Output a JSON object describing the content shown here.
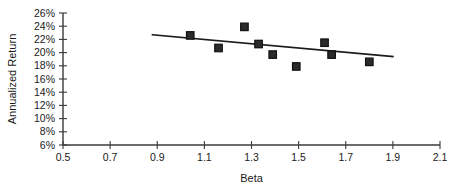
{
  "chart_data": {
    "type": "scatter",
    "title": "",
    "xlabel": "Beta",
    "ylabel": "Annualized Return",
    "xlim": [
      0.5,
      2.1
    ],
    "ylim": [
      6,
      26
    ],
    "xticks": [
      "0.5",
      "0.7",
      "0.9",
      "1.1",
      "1.3",
      "1.5",
      "1.7",
      "1.9",
      "2.1"
    ],
    "xtick_values": [
      0.5,
      0.7,
      0.9,
      1.1,
      1.3,
      1.5,
      1.7,
      1.9,
      2.1
    ],
    "yticks": [
      "6%",
      "8%",
      "10%",
      "12%",
      "14%",
      "16%",
      "18%",
      "20%",
      "22%",
      "24%",
      "26%"
    ],
    "ytick_values": [
      6,
      8,
      10,
      12,
      14,
      16,
      18,
      20,
      22,
      24,
      26
    ],
    "grid": false,
    "legend": false,
    "marker_shape": "filled-square",
    "marker_color": "#2b2b2b",
    "trendline_color": "#1c1c1c",
    "axis_color": "#3a3a3a",
    "series": [
      {
        "name": "Annualized Return vs Beta",
        "points": [
          {
            "x": 1.04,
            "y": 22.6
          },
          {
            "x": 1.16,
            "y": 20.7
          },
          {
            "x": 1.27,
            "y": 23.9
          },
          {
            "x": 1.33,
            "y": 21.3
          },
          {
            "x": 1.39,
            "y": 19.7
          },
          {
            "x": 1.49,
            "y": 17.9
          },
          {
            "x": 1.61,
            "y": 21.5
          },
          {
            "x": 1.64,
            "y": 19.7
          },
          {
            "x": 1.8,
            "y": 18.6
          }
        ]
      }
    ],
    "trendline": {
      "type": "linear-fit",
      "x_start": 0.88,
      "y_start": 22.7,
      "x_end": 1.9,
      "y_end": 19.4
    }
  }
}
